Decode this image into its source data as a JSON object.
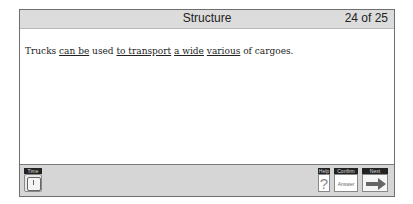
{
  "header": {
    "title": "Structure",
    "counter": "24 of 25"
  },
  "question": {
    "segments": [
      {
        "text": "Trucks ",
        "underlined": false
      },
      {
        "text": "can be",
        "underlined": true
      },
      {
        "text": " used ",
        "underlined": false
      },
      {
        "text": "to transport",
        "underlined": true
      },
      {
        "text": " ",
        "underlined": false
      },
      {
        "text": "a wide",
        "underlined": true
      },
      {
        "text": " ",
        "underlined": false
      },
      {
        "text": "various",
        "underlined": true
      },
      {
        "text": " of cargoes.",
        "underlined": false
      }
    ]
  },
  "footer": {
    "time_label": "Time",
    "help_label": "Help",
    "help_icon": "?",
    "confirm_label": "Confirm",
    "confirm_button": "Answer",
    "next_label": "Next"
  }
}
